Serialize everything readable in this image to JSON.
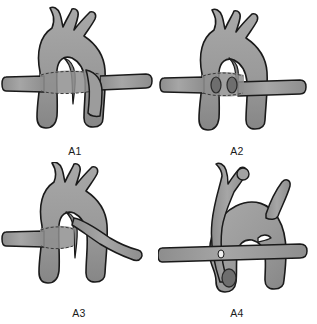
{
  "figure": {
    "kind": "medical-illustration",
    "background_color": "#ffffff",
    "vessel_fill": "#9b9b9b",
    "vessel_fill_light": "#a9a9a9",
    "vessel_fill_dark": "#8a8a8a",
    "lesion_color": "#6e6e6e",
    "outline_color": "#1a1a1a",
    "label_color": "#1a1a1a",
    "layout": "2x2 grid of four panels"
  },
  "panels": [
    {
      "id": "A1",
      "label": "A1",
      "position": "top-left",
      "description": "Aortic arch with three superior branch vessels; a horizontal tubular vessel passes behind the arch, shown as a translucent encircling band"
    },
    {
      "id": "A2",
      "label": "A2",
      "position": "top-right",
      "description": "Aortic arch with horizontal vessel interrupted behind the arch; two small dark oval stump markers visible within the translucent band"
    },
    {
      "id": "A3",
      "label": "A3",
      "position": "bottom-left",
      "description": "Aortic arch with horizontal vessel crossing on the left and a separate branch arising and curving down to the right"
    },
    {
      "id": "A4",
      "label": "A4",
      "position": "bottom-right",
      "description": "Rotated aortic arch viewed obliquely with a tall looping branch on the left, a horizontal vessel crossing in front, and a dark oval lesion marker low on the left"
    }
  ]
}
